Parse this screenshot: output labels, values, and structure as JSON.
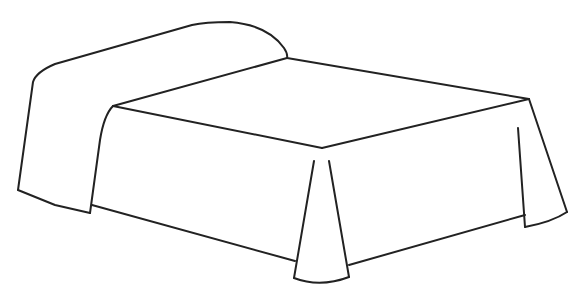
{
  "image": {
    "subject": "bed line drawing",
    "background_color": "#ffffff",
    "stroke_color": "#222222"
  }
}
